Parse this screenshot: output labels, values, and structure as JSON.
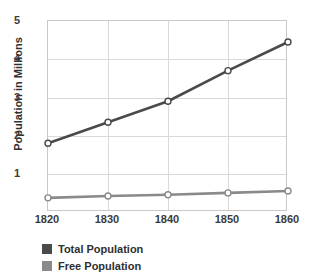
{
  "chart_data": {
    "type": "line",
    "title": "",
    "xlabel": "",
    "ylabel": "Population in Millions",
    "x": [
      1820,
      1830,
      1840,
      1850,
      1860
    ],
    "xtick_labels": [
      "1820",
      "1830",
      "1840",
      "1850",
      "1860"
    ],
    "ytick_labels": [
      "1",
      "2",
      "3",
      "4",
      "5"
    ],
    "ytick_values": [
      1,
      2,
      3,
      4,
      5
    ],
    "ylim": [
      0,
      5
    ],
    "xlim": [
      1820,
      1860
    ],
    "grid": true,
    "legend_position": "bottom-left",
    "series": [
      {
        "name": "Total Population",
        "color": "#4a4a4a",
        "marker": "open-circle",
        "values": [
          1.8,
          2.35,
          2.9,
          3.7,
          4.45
        ]
      },
      {
        "name": "Free Population",
        "color": "#8a8a8a",
        "marker": "open-circle",
        "values": [
          0.37,
          0.42,
          0.45,
          0.5,
          0.55
        ]
      }
    ]
  },
  "colors": {
    "total_population": "#4a4a4a",
    "free_population": "#8a8a8a",
    "gridline": "#d9d9d9",
    "axis_border": "#c9c9c9",
    "text": "#2f2f2f",
    "background": "#ffffff"
  },
  "axis": {
    "y_title": "Population in Millions",
    "y_ticks": [
      "5",
      "4",
      "3",
      "2",
      "1"
    ],
    "x_ticks": [
      "1820",
      "1830",
      "1840",
      "1850",
      "1860"
    ]
  },
  "legend": {
    "items": [
      {
        "label": "Total Population",
        "color": "#4a4a4a"
      },
      {
        "label": "Free Population",
        "color": "#8a8a8a"
      }
    ]
  }
}
